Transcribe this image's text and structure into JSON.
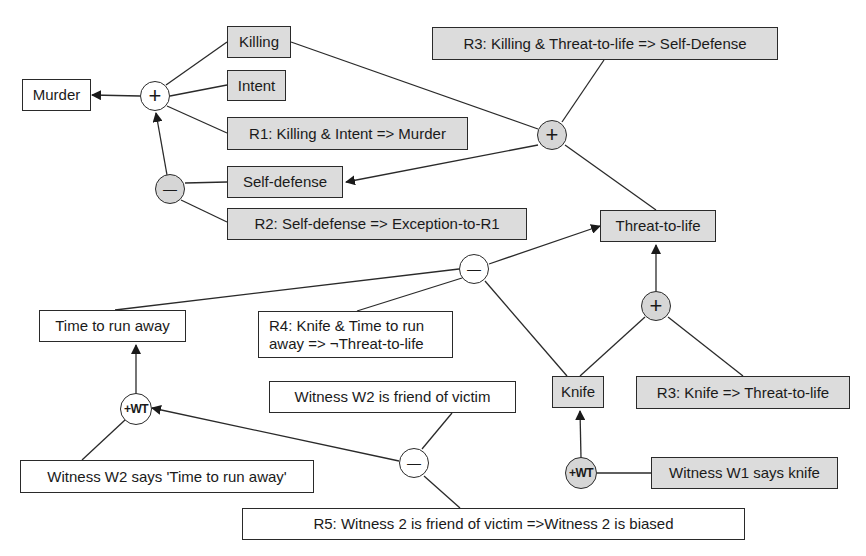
{
  "diagram": {
    "nodes": {
      "murder": "Murder",
      "killing": "Killing",
      "intent": "Intent",
      "r1": "R1: Killing & Intent => Murder",
      "self_defense": "Self-defense",
      "r2": "R2: Self-defense => Exception-to-R1",
      "r3_top": "R3: Killing & Threat-to-life => Self-Defense",
      "threat_to_life": "Threat-to-life",
      "time_to_run_away": "Time to run away",
      "r4": "R4: Knife & Time to run away => ¬Threat-to-life",
      "knife": "Knife",
      "r3_knife": "R3: Knife => Threat-to-life",
      "witness_w2_friend": "Witness W2 is friend of victim",
      "witness_w2_says": "Witness W2 says 'Time to run away'",
      "r5": "R5: Witness 2 is friend of victim =>Witness 2 is biased",
      "witness_w1_says": "Witness W1 says knife"
    },
    "operators": {
      "plus": "+",
      "minus": "—",
      "wt": "+WT"
    },
    "colors": {
      "gray_fill": "#dcdcdc",
      "white_fill": "#ffffff",
      "stroke": "#2a2a2a"
    }
  }
}
